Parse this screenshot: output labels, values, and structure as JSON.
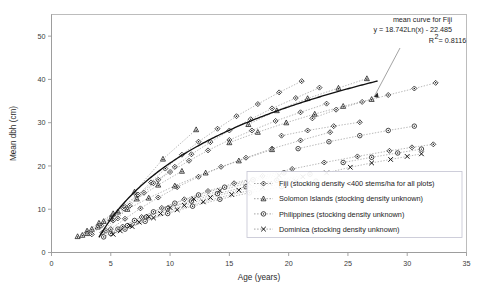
{
  "chart_data": {
    "type": "scatter",
    "title": "",
    "xlabel": "Age (years)",
    "ylabel": "Mean dbh (cm)",
    "xlim": [
      0,
      35
    ],
    "ylim": [
      0,
      55
    ],
    "xticks": [
      0,
      5,
      10,
      15,
      20,
      25,
      30,
      35
    ],
    "yticks": [
      0,
      10,
      20,
      30,
      40,
      50
    ],
    "grid": false,
    "legend_position": "inside-lower-right",
    "annotation": {
      "line1": "mean curve for Fiji",
      "line2": "y = 18.742Ln(x) - 22.485",
      "line3": "R",
      "line3_sup": "2",
      "line3_rest": " = 0.8116"
    },
    "fit": {
      "name": "mean curve for Fiji",
      "form": "y = 18.742*Ln(x) - 22.485",
      "r_squared": 0.8116,
      "x_start": 4.0,
      "x_end": 27.5
    },
    "series": [
      {
        "name": "Fiji (stocking density <400 stems/ha for all plots)",
        "marker": "diamond-open",
        "linestyle": "dotted",
        "plots": [
          {
            "x": [
              4.3,
              5.2,
              6.1,
              7.2,
              8.4,
              9.6,
              11.0,
              12.4,
              14.0,
              15.6,
              17.4,
              19.2,
              21.1
            ],
            "y": [
              4.6,
              7.4,
              10.2,
              13.1,
              16.2,
              19.4,
              22.6,
              25.6,
              28.6,
              31.5,
              34.3,
              37.0,
              39.6
            ]
          },
          {
            "x": [
              4.6,
              5.6,
              6.6,
              7.8,
              9.0,
              10.4,
              11.8,
              13.4,
              15.0,
              16.8,
              18.6,
              20.6,
              22.6
            ],
            "y": [
              5.0,
              7.9,
              10.8,
              13.8,
              16.8,
              19.8,
              22.7,
              25.5,
              28.2,
              30.8,
              33.3,
              35.7,
              38.1
            ]
          },
          {
            "x": [
              3.4,
              4.2,
              5.1,
              6.1,
              7.3,
              8.6,
              10.0,
              11.6,
              13.2,
              15.0,
              16.9,
              18.9,
              21.0,
              23.2
            ],
            "y": [
              4.2,
              6.2,
              8.4,
              10.8,
              13.4,
              16.0,
              18.6,
              21.2,
              23.6,
              26.0,
              28.2,
              30.4,
              32.4,
              34.4
            ]
          },
          {
            "x": [
              5.0,
              6.2,
              7.5,
              9.0,
              10.6,
              12.4,
              14.3,
              16.4,
              18.6,
              21.0,
              23.5
            ],
            "y": [
              5.4,
              7.8,
              10.2,
              12.7,
              15.1,
              17.5,
              19.8,
              21.9,
              24.0,
              25.9,
              27.8
            ]
          },
          {
            "x": [
              6.0,
              7.6,
              9.3,
              11.2,
              13.2,
              15.4,
              17.8,
              20.3,
              23.0,
              25.8,
              28.5,
              30.4,
              32.2
            ],
            "y": [
              6.0,
              8.2,
              10.3,
              12.3,
              14.2,
              16.0,
              17.7,
              19.3,
              20.8,
              22.2,
              23.5,
              24.3,
              25.0
            ]
          },
          {
            "x": [
              22.0,
              24.0,
              26.2,
              28.4,
              30.6,
              32.4
            ],
            "y": [
              31.0,
              33.0,
              34.8,
              36.4,
              37.9,
              39.2
            ]
          },
          {
            "x": [
              19.4,
              21.6,
              23.8,
              26.0
            ],
            "y": [
              27.0,
              28.2,
              29.2,
              30.1
            ]
          }
        ]
      },
      {
        "name": "Solomon Islands (stocking density unknown)",
        "marker": "triangle-open",
        "linestyle": "dotted",
        "plots": [
          {
            "x": [
              2.2,
              3.0,
              4.0,
              5.2,
              7.0,
              9.4,
              12.2
            ],
            "y": [
              3.7,
              5.0,
              6.8,
              9.0,
              14.0,
              21.6,
              28.4
            ]
          },
          {
            "x": [
              2.6,
              3.4,
              4.4,
              5.6,
              7.2,
              9.0,
              11.0
            ],
            "y": [
              4.0,
              5.4,
              7.2,
              9.4,
              12.4,
              15.6,
              18.8
            ]
          },
          {
            "x": [
              3.0,
              3.9,
              5.0,
              6.4,
              8.2,
              10.4,
              13.0,
              15.8,
              18.6
            ],
            "y": [
              4.4,
              5.9,
              7.8,
              10.0,
              12.6,
              15.4,
              18.4,
              21.2,
              23.8
            ]
          },
          {
            "x": [
              16.6,
              19.0,
              21.6,
              24.2,
              26.6
            ],
            "y": [
              29.6,
              32.8,
              35.6,
              38.0,
              40.2
            ]
          },
          {
            "x": [
              15.0,
              17.4,
              19.8,
              22.2,
              24.6,
              27.0
            ],
            "y": [
              25.4,
              27.8,
              30.0,
              32.0,
              33.8,
              35.4
            ]
          }
        ]
      },
      {
        "name": "Philippines (stocking density unknown)",
        "marker": "circle-open",
        "linestyle": "dotted",
        "plots": [
          {
            "x": [
              4.4,
              5.6,
              7.0,
              8.6,
              10.4,
              12.4,
              14.6,
              17.0,
              19.6
            ],
            "y": [
              3.6,
              5.4,
              7.4,
              9.4,
              11.4,
              13.3,
              15.1,
              16.8,
              18.4
            ]
          },
          {
            "x": [
              5.0,
              6.4,
              8.0,
              9.8,
              11.8,
              14.0,
              16.4,
              19.0,
              21.8
            ],
            "y": [
              4.4,
              6.2,
              8.2,
              10.1,
              11.9,
              13.6,
              15.2,
              16.7,
              18.1
            ]
          },
          {
            "x": [
              6.2,
              7.9,
              9.8,
              11.9,
              14.2,
              16.7,
              19.4,
              22.3
            ],
            "y": [
              5.4,
              7.2,
              9.0,
              10.7,
              12.3,
              13.8,
              15.2,
              16.5
            ]
          },
          {
            "x": [
              20.8,
              23.4,
              26.0,
              28.4,
              30.6
            ],
            "y": [
              24.0,
              25.6,
              27.0,
              28.2,
              29.2
            ]
          },
          {
            "x": [
              24.6,
              27.0,
              29.2,
              31.2
            ],
            "y": [
              20.8,
              22.0,
              23.0,
              23.9
            ]
          }
        ]
      },
      {
        "name": "Dominica (stocking density unknown)",
        "marker": "x-cross",
        "linestyle": "dotted",
        "plots": [
          {
            "x": [
              5.2,
              6.6,
              8.2,
              10.0,
              12.0,
              14.2,
              16.6,
              19.2
            ],
            "y": [
              4.2,
              6.2,
              8.3,
              10.4,
              12.4,
              14.3,
              16.1,
              17.8
            ]
          },
          {
            "x": [
              5.8,
              7.4,
              9.2,
              11.2,
              13.4,
              15.8,
              18.4,
              21.2
            ],
            "y": [
              5.0,
              7.0,
              9.0,
              10.9,
              12.7,
              14.4,
              16.0,
              17.5
            ]
          },
          {
            "x": [
              6.8,
              8.6,
              10.6,
              12.8,
              15.2,
              17.8,
              20.6
            ],
            "y": [
              6.0,
              8.0,
              9.9,
              11.7,
              13.4,
              15.0,
              16.5
            ]
          },
          {
            "x": [
              23.2,
              25.2,
              27.0,
              28.6,
              30.0,
              31.2
            ],
            "y": [
              18.4,
              19.7,
              20.7,
              21.5,
              22.2,
              22.8
            ]
          }
        ]
      }
    ]
  },
  "legend": {
    "items": [
      {
        "label": "Fiji (stocking density <400 stems/ha for all plots)",
        "marker": "diamond-open"
      },
      {
        "label": "Solomon Islands (stocking density unknown)",
        "marker": "triangle-open"
      },
      {
        "label": "Philippines (stocking density unknown)",
        "marker": "circle-open"
      },
      {
        "label": "Dominica (stocking density unknown)",
        "marker": "x-cross"
      }
    ]
  }
}
